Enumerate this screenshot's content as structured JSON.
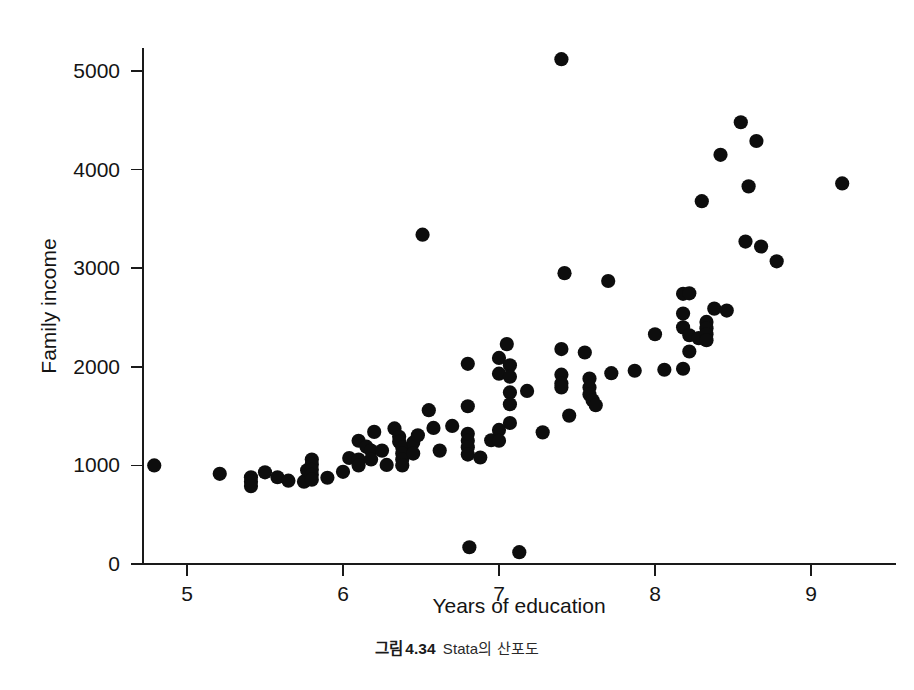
{
  "figure": {
    "caption_prefix": "그림",
    "caption_number": "4.34",
    "caption_text": "Stata의 산포도"
  },
  "chart_data": {
    "type": "scatter",
    "title": "",
    "xlabel": "Years of education",
    "ylabel": "Family income",
    "xlim": [
      4.6,
      9.45
    ],
    "ylim": [
      -80,
      5400
    ],
    "xticks": [
      5,
      6,
      7,
      8,
      9
    ],
    "yticks": [
      0,
      1000,
      2000,
      3000,
      4000,
      5000
    ],
    "xtick_labels": [
      "5",
      "6",
      "7",
      "8",
      "9"
    ],
    "ytick_labels": [
      "0",
      "1000",
      "2000",
      "3000",
      "4000",
      "5000"
    ],
    "grid": false,
    "legend": null,
    "marker": {
      "shape": "circle",
      "color": "#0d0d0d",
      "size": 9
    },
    "n_points": 118,
    "points": [
      [
        4.79,
        1000
      ],
      [
        5.21,
        915
      ],
      [
        5.41,
        880
      ],
      [
        5.41,
        835
      ],
      [
        5.41,
        790
      ],
      [
        5.5,
        930
      ],
      [
        5.58,
        880
      ],
      [
        5.65,
        845
      ],
      [
        5.75,
        835
      ],
      [
        5.77,
        950
      ],
      [
        5.8,
        1060
      ],
      [
        5.8,
        1010
      ],
      [
        5.8,
        955
      ],
      [
        5.8,
        905
      ],
      [
        5.8,
        855
      ],
      [
        5.9,
        875
      ],
      [
        6.0,
        935
      ],
      [
        6.04,
        1075
      ],
      [
        6.1,
        1250
      ],
      [
        6.1,
        1060
      ],
      [
        6.1,
        1000
      ],
      [
        6.15,
        1190
      ],
      [
        6.18,
        1150
      ],
      [
        6.18,
        1060
      ],
      [
        6.2,
        1340
      ],
      [
        6.25,
        1150
      ],
      [
        6.28,
        1005
      ],
      [
        6.33,
        1375
      ],
      [
        6.36,
        1290
      ],
      [
        6.36,
        1240
      ],
      [
        6.38,
        1180
      ],
      [
        6.38,
        1120
      ],
      [
        6.38,
        1060
      ],
      [
        6.38,
        1000
      ],
      [
        6.45,
        1230
      ],
      [
        6.45,
        1120
      ],
      [
        6.48,
        1305
      ],
      [
        6.51,
        3340
      ],
      [
        6.55,
        1560
      ],
      [
        6.58,
        1380
      ],
      [
        6.62,
        1150
      ],
      [
        6.7,
        1400
      ],
      [
        6.8,
        2030
      ],
      [
        6.8,
        1600
      ],
      [
        6.8,
        1320
      ],
      [
        6.8,
        1250
      ],
      [
        6.8,
        1185
      ],
      [
        6.8,
        1110
      ],
      [
        6.81,
        170
      ],
      [
        6.88,
        1080
      ],
      [
        6.95,
        1255
      ],
      [
        7.0,
        2090
      ],
      [
        7.0,
        1930
      ],
      [
        7.0,
        1360
      ],
      [
        7.0,
        1250
      ],
      [
        7.05,
        2230
      ],
      [
        7.07,
        2015
      ],
      [
        7.07,
        1900
      ],
      [
        7.07,
        1740
      ],
      [
        7.07,
        1620
      ],
      [
        7.07,
        1430
      ],
      [
        7.13,
        120
      ],
      [
        7.18,
        1755
      ],
      [
        7.28,
        1335
      ],
      [
        7.4,
        5120
      ],
      [
        7.4,
        2180
      ],
      [
        7.4,
        1920
      ],
      [
        7.4,
        1830
      ],
      [
        7.4,
        1790
      ],
      [
        7.42,
        2950
      ],
      [
        7.45,
        1505
      ],
      [
        7.55,
        2145
      ],
      [
        7.58,
        1880
      ],
      [
        7.58,
        1790
      ],
      [
        7.58,
        1720
      ],
      [
        7.6,
        1660
      ],
      [
        7.62,
        1610
      ],
      [
        7.7,
        2870
      ],
      [
        7.72,
        1935
      ],
      [
        7.87,
        1960
      ],
      [
        8.0,
        2330
      ],
      [
        8.06,
        1970
      ],
      [
        8.18,
        2740
      ],
      [
        8.18,
        2540
      ],
      [
        8.18,
        2400
      ],
      [
        8.18,
        1980
      ],
      [
        8.22,
        2745
      ],
      [
        8.22,
        2320
      ],
      [
        8.22,
        2155
      ],
      [
        8.28,
        2290
      ],
      [
        8.3,
        3680
      ],
      [
        8.33,
        2455
      ],
      [
        8.33,
        2390
      ],
      [
        8.33,
        2330
      ],
      [
        8.33,
        2270
      ],
      [
        8.38,
        2590
      ],
      [
        8.42,
        4150
      ],
      [
        8.46,
        2570
      ],
      [
        8.55,
        4480
      ],
      [
        8.58,
        3270
      ],
      [
        8.6,
        3830
      ],
      [
        8.65,
        4290
      ],
      [
        8.68,
        3220
      ],
      [
        8.78,
        3070
      ],
      [
        9.2,
        3860
      ]
    ]
  }
}
